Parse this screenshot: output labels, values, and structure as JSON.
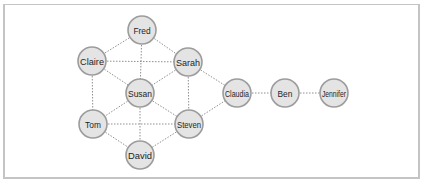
{
  "diagram": {
    "type": "social-network-graph",
    "node_radius": 14,
    "colors": {
      "node_fill": "#e4e4e4",
      "node_stroke": "#9c9c9c",
      "edge": "#8f8f8f",
      "text": "#1f1f1f",
      "frame": "#c4c4c4"
    },
    "nodes": [
      {
        "id": "fred",
        "label": "Fred",
        "x": 142,
        "y": 30
      },
      {
        "id": "claire",
        "label": "Claire",
        "x": 92,
        "y": 61
      },
      {
        "id": "sarah",
        "label": "Sarah",
        "x": 188,
        "y": 62
      },
      {
        "id": "susan",
        "label": "Susan",
        "x": 140,
        "y": 93
      },
      {
        "id": "tom",
        "label": "Tom",
        "x": 93,
        "y": 124
      },
      {
        "id": "steven",
        "label": "Steven",
        "x": 189,
        "y": 124
      },
      {
        "id": "david",
        "label": "David",
        "x": 140,
        "y": 155
      },
      {
        "id": "claudia",
        "label": "Claudia",
        "x": 237,
        "y": 93
      },
      {
        "id": "ben",
        "label": "Ben",
        "x": 285,
        "y": 93
      },
      {
        "id": "jennifer",
        "label": "Jennifer",
        "x": 334,
        "y": 93
      }
    ],
    "edges": [
      [
        "fred",
        "claire"
      ],
      [
        "fred",
        "sarah"
      ],
      [
        "fred",
        "susan"
      ],
      [
        "claire",
        "sarah"
      ],
      [
        "claire",
        "susan"
      ],
      [
        "sarah",
        "susan"
      ],
      [
        "claire",
        "tom"
      ],
      [
        "sarah",
        "steven"
      ],
      [
        "sarah",
        "claudia"
      ],
      [
        "susan",
        "tom"
      ],
      [
        "susan",
        "steven"
      ],
      [
        "susan",
        "david"
      ],
      [
        "tom",
        "steven"
      ],
      [
        "tom",
        "david"
      ],
      [
        "steven",
        "david"
      ],
      [
        "steven",
        "claudia"
      ],
      [
        "claudia",
        "ben"
      ],
      [
        "ben",
        "jennifer"
      ]
    ]
  }
}
